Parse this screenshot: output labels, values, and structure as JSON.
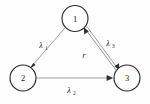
{
  "diagram": {
    "type": "directed-graph",
    "background_color": "#fefefe",
    "node_stroke_color": "#2b2b2b",
    "edge_color": "#9a9a9a",
    "arrow_color": "#2e2e2e",
    "nodes": [
      {
        "id": "1",
        "label": "1",
        "cx": 75,
        "cy": 18.5,
        "r": 13
      },
      {
        "id": "2",
        "label": "2",
        "cx": 23,
        "cy": 78,
        "r": 13
      },
      {
        "id": "3",
        "label": "3",
        "cx": 127,
        "cy": 78,
        "r": 13
      }
    ],
    "edges": [
      {
        "id": "e1",
        "from": "1",
        "to": "2",
        "label": "λ",
        "subscript": "1"
      },
      {
        "id": "e2",
        "from": "2",
        "to": "3",
        "label": "λ",
        "subscript": "2"
      },
      {
        "id": "e3",
        "from": "1",
        "to": "3",
        "label": "λ",
        "subscript": "3"
      },
      {
        "id": "e4",
        "from": "3",
        "to": "1",
        "label": "r",
        "subscript": ""
      }
    ]
  }
}
